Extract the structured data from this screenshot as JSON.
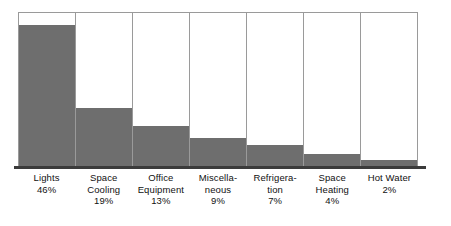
{
  "chart_data": {
    "type": "bar",
    "title": "",
    "subtitle": "",
    "xlabel": "",
    "ylabel": "",
    "ylim": [
      0,
      50
    ],
    "grid": false,
    "legend": false,
    "value_suffix": "%",
    "categories": [
      "Lights",
      "Space Cooling",
      "Office Equipment",
      "Miscellaneous",
      "Refrigeration",
      "Space Heating",
      "Hot Water"
    ],
    "values": [
      46,
      19,
      13,
      9,
      7,
      4,
      2
    ],
    "bars": [
      {
        "category": "Lights",
        "value": 46,
        "value_label": "46%",
        "label_lines": [
          "Lights",
          "46%"
        ]
      },
      {
        "category": "Space Cooling",
        "value": 19,
        "value_label": "19%",
        "label_lines": [
          "Space",
          "Cooling",
          "19%"
        ]
      },
      {
        "category": "Office Equipment",
        "value": 13,
        "value_label": "13%",
        "label_lines": [
          "Office",
          "Equipment",
          "13%"
        ]
      },
      {
        "category": "Miscellaneous",
        "value": 9,
        "value_label": "9%",
        "label_lines": [
          "Miscella-",
          "neous",
          "9%"
        ]
      },
      {
        "category": "Refrigeration",
        "value": 7,
        "value_label": "7%",
        "label_lines": [
          "Refrigera-",
          "tion",
          "7%"
        ]
      },
      {
        "category": "Space Heating",
        "value": 4,
        "value_label": "4%",
        "label_lines": [
          "Space",
          "Heating",
          "4%"
        ]
      },
      {
        "category": "Hot Water",
        "value": 2,
        "value_label": "2%",
        "label_lines": [
          "Hot Water",
          "2%"
        ]
      }
    ]
  },
  "style": {
    "bar_fill_color": "#6e6e6e",
    "column_border_color": "#9a9a9a",
    "baseline_color": "#3b3b3b",
    "background_color": "#ffffff",
    "text_color": "#111111"
  }
}
